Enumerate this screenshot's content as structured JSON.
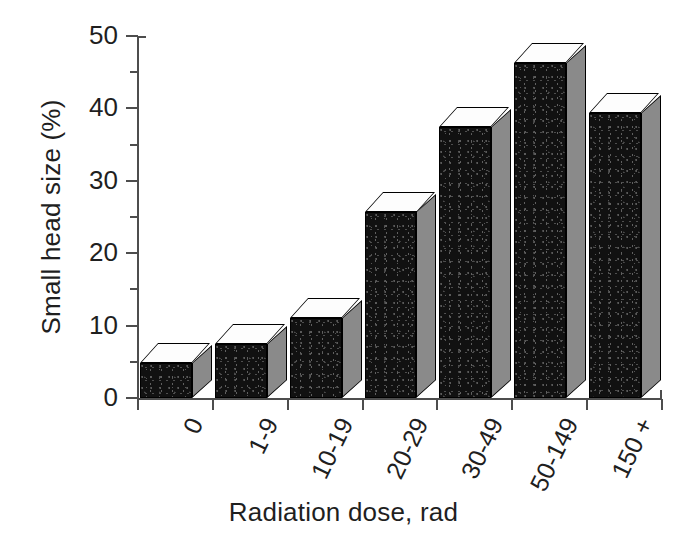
{
  "chart_data": {
    "type": "bar",
    "title": "",
    "subtitle": "",
    "xlabel": "Radiation dose, rad",
    "ylabel": "Small head size (%)",
    "categories": [
      "0",
      "1-9",
      "10-19",
      "20-29",
      "30-49",
      "50-149",
      "150 +"
    ],
    "values": [
      4.8,
      7.5,
      11.0,
      25.7,
      37.4,
      46.3,
      39.4
    ],
    "ylim": [
      0,
      50
    ],
    "ytick_labels": [
      "0",
      "10",
      "20",
      "30",
      "40",
      "50"
    ],
    "ytick_values": [
      0,
      10,
      20,
      30,
      40,
      50
    ],
    "yminor_tick_values": [
      5,
      15,
      25,
      35,
      45
    ],
    "grid": false,
    "legend": null,
    "legend_position": "none",
    "style": "3d-bar",
    "bar_face_color": "#111111",
    "bar_top_color": "#fdfdfd",
    "bar_side_color": "#8a8a8a",
    "axis_color": "#4d4d4d",
    "text_color": "#1f1f1f",
    "background_color": "#ffffff"
  }
}
